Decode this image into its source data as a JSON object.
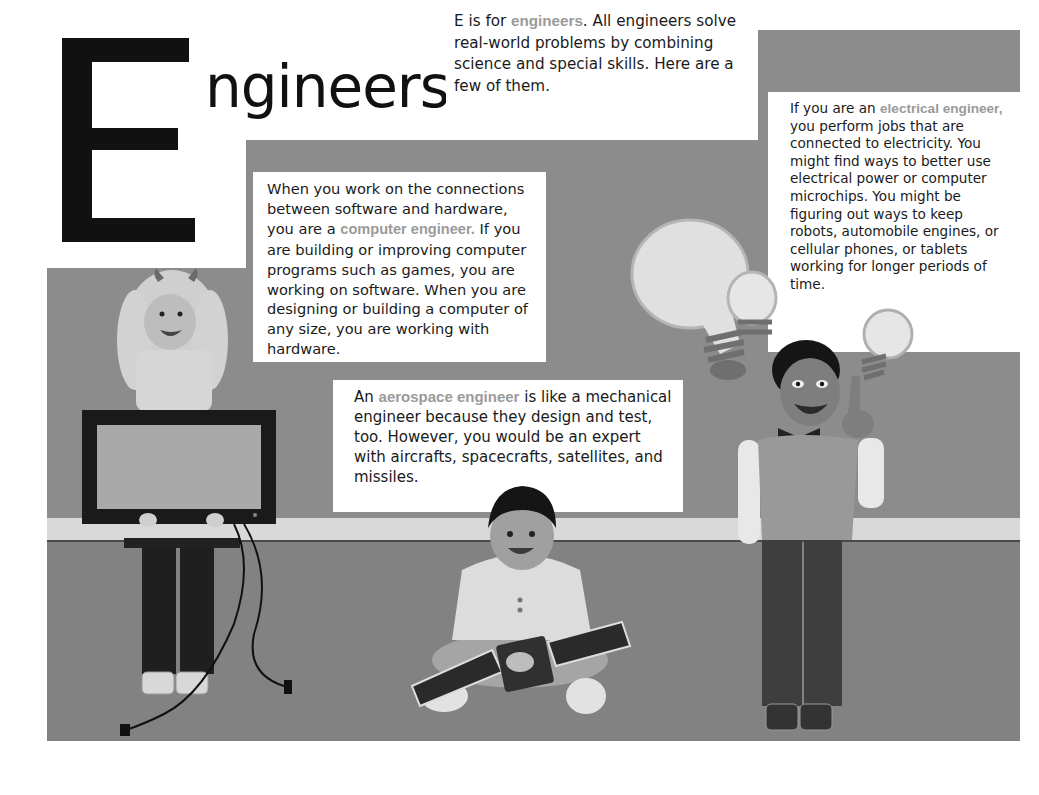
{
  "title": {
    "initial": "E",
    "rest": "ngineers"
  },
  "intro": {
    "pre": "E is for ",
    "highlight": "engineers",
    "post": ". All engineers solve real-world problems by combining science and special skills. Here are a few of them."
  },
  "computer_engineer": {
    "pre": "When you work on the connections between software and hardware, you are a ",
    "highlight": "computer engineer.",
    "post": "  If you are building or improving computer programs such as games, you are working on software. When you are designing or building a computer of any size, you are working with hardware."
  },
  "electrical_engineer": {
    "pre": "If you are an ",
    "highlight": "electrical engineer,",
    "post": " you perform jobs that are connected to electricity. You might find ways to better use electrical power or computer microchips. You might be figuring out ways to keep robots, automobile engines, or cellular phones, or tablets working for longer periods of time."
  },
  "aerospace_engineer": {
    "pre": "An ",
    "highlight": "aerospace engineer",
    "post": " is like a mechanical engineer because they design and test, too. However, you would be an expert with aircrafts, spacecrafts, satellites, and missiles."
  },
  "illustrations": {
    "girl": "girl-holding-monitor",
    "boy_sitting": "boy-holding-satellite",
    "boy_standing": "boy-with-lightbulbs"
  },
  "colors": {
    "wall": "#8c8c8c",
    "floor": "#828282",
    "stripe": "#d9d9d9",
    "highlight_text": "#9a9a9a",
    "body_text": "#1a1a1a"
  }
}
